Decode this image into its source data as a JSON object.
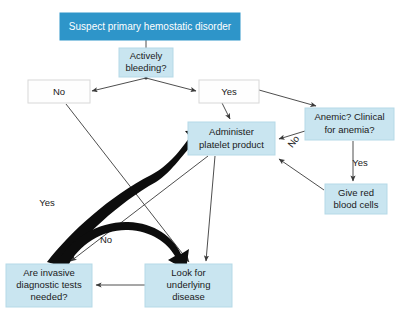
{
  "diagram": {
    "colors": {
      "header_fill": "#2e95c9",
      "header_text": "#ffffff",
      "light_fill": "#c9e5f0",
      "white_fill": "#fefefe",
      "line": "#3a3a3a",
      "thick_arrow": "#0d0d0d",
      "background": "#ffffff"
    },
    "nodes": [
      {
        "id": "suspect",
        "label": "Suspect primary hemostatic disorder",
        "lines": [
          "Suspect primary hemostatic disorder"
        ],
        "style": "header",
        "x": 60,
        "y": 13,
        "w": 180,
        "h": 27
      },
      {
        "id": "actively_bleeding",
        "label": "Actively bleeding?",
        "lines": [
          "Actively",
          "bleeding?"
        ],
        "style": "light",
        "x": 119,
        "y": 48,
        "w": 54,
        "h": 29
      },
      {
        "id": "no_bleeding",
        "label": "No",
        "lines": [
          "No"
        ],
        "style": "white",
        "x": 28,
        "y": 80,
        "w": 62,
        "h": 23
      },
      {
        "id": "yes_bleeding",
        "label": "Yes",
        "lines": [
          "Yes"
        ],
        "style": "white",
        "x": 199,
        "y": 80,
        "w": 60,
        "h": 23
      },
      {
        "id": "anemic",
        "label": "Anemic? Clinical for anemia?",
        "lines": [
          "Anemic? Clinical",
          "for anemia?"
        ],
        "style": "light",
        "x": 305,
        "y": 108,
        "w": 89,
        "h": 32
      },
      {
        "id": "administer_platelet",
        "label": "Administer platelet product",
        "lines": [
          "Administer",
          "platelet product"
        ],
        "style": "light",
        "x": 188,
        "y": 122,
        "w": 87,
        "h": 33
      },
      {
        "id": "give_red_blood_cells",
        "label": "Give red blood cells",
        "lines": [
          "Give red",
          "blood cells"
        ],
        "style": "light",
        "x": 325,
        "y": 184,
        "w": 62,
        "h": 30
      },
      {
        "id": "invasive_tests",
        "label": "Are invasive diagnostic tests needed?",
        "lines": [
          "Are invasive",
          "diagnostic tests",
          "needed?"
        ],
        "style": "light",
        "x": 6,
        "y": 264,
        "w": 86,
        "h": 43
      },
      {
        "id": "look_underlying",
        "label": "Look for underlying disease",
        "lines": [
          "Look for",
          "underlying",
          "disease"
        ],
        "style": "light",
        "x": 145,
        "y": 264,
        "w": 87,
        "h": 43
      }
    ],
    "edge_labels": [
      {
        "id": "yes_invasive",
        "text": "Yes",
        "x": 47,
        "y": 203,
        "rotate": 0
      },
      {
        "id": "no_invasive",
        "text": "No",
        "x": 106,
        "y": 240,
        "rotate": 0
      },
      {
        "id": "no_anemic",
        "text": "No",
        "x": 294,
        "y": 142,
        "rotate": -52
      },
      {
        "id": "yes_anemic",
        "text": "Yes",
        "x": 360,
        "y": 163,
        "rotate": 0
      }
    ],
    "edges": [
      {
        "from": "suspect",
        "to": "actively_bleeding",
        "kind": "plain"
      },
      {
        "from": "actively_bleeding",
        "to": "no_bleeding",
        "kind": "arrow"
      },
      {
        "from": "actively_bleeding",
        "to": "yes_bleeding",
        "kind": "arrow"
      },
      {
        "from": "yes_bleeding",
        "to": "anemic",
        "kind": "arrow"
      },
      {
        "from": "yes_bleeding",
        "to": "administer_platelet",
        "kind": "arrow"
      },
      {
        "from": "anemic",
        "to": "administer_platelet",
        "kind": "arrow",
        "label": "No"
      },
      {
        "from": "anemic",
        "to": "give_red_blood_cells",
        "kind": "arrow",
        "label": "Yes"
      },
      {
        "from": "give_red_blood_cells",
        "to": "administer_platelet",
        "kind": "arrow"
      },
      {
        "from": "no_bleeding",
        "to": "look_underlying",
        "kind": "arrow"
      },
      {
        "from": "administer_platelet",
        "to": "invasive_tests",
        "kind": "arrow"
      },
      {
        "from": "administer_platelet",
        "to": "look_underlying",
        "kind": "arrow"
      },
      {
        "from": "look_underlying",
        "to": "invasive_tests",
        "kind": "arrow"
      },
      {
        "from": "invasive_tests",
        "to": "administer_platelet",
        "kind": "thick",
        "label": "Yes"
      },
      {
        "from": "invasive_tests",
        "to": "look_underlying",
        "kind": "thick",
        "label": "No"
      }
    ]
  }
}
